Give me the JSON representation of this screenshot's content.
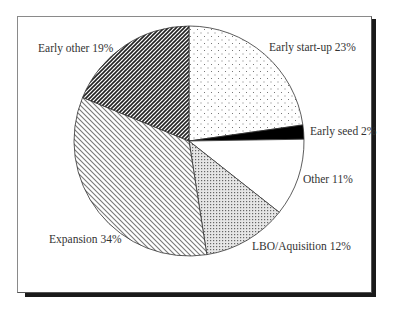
{
  "chart_data": {
    "type": "pie",
    "title": "",
    "start_angle": "12 o'clock",
    "direction": "clockwise",
    "slices": [
      {
        "label": "Early start-up",
        "value": 23,
        "display": "Early start-up 23%",
        "fill": "sparse-dots"
      },
      {
        "label": "Early seed",
        "value": 2,
        "display": "Early seed 2%",
        "fill": "solid-black"
      },
      {
        "label": "Other",
        "value": 11,
        "display": "Other 11%",
        "fill": "white"
      },
      {
        "label": "LBO/Aquisition",
        "value": 12,
        "display": "LBO/Aquisition 12%",
        "fill": "fine-dots"
      },
      {
        "label": "Expansion",
        "value": 34,
        "display": "Expansion 34%",
        "fill": "light-diagonal"
      },
      {
        "label": "Early other",
        "value": 19,
        "display": "Early other 19%",
        "fill": "dark-diagonal"
      }
    ],
    "legend": "none (inline labels)",
    "grid": false
  }
}
